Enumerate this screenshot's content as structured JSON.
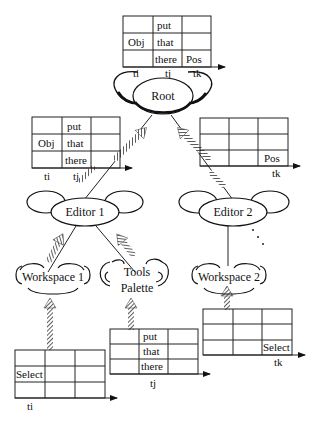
{
  "diagram": {
    "nodes": {
      "root": {
        "label": "Root"
      },
      "editor1": {
        "label": "Editor 1"
      },
      "editor2": {
        "label": "Editor 2"
      },
      "workspace1": {
        "label": "Workspace 1"
      },
      "tools_palette": {
        "label_line1": "Tools",
        "label_line2": "Palette"
      },
      "workspace2": {
        "label": "Workspace 2"
      }
    },
    "tables": {
      "root_table": {
        "cells": [
          [
            "",
            "put",
            ""
          ],
          [
            "Obj",
            "that",
            ""
          ],
          [
            "",
            "there",
            "Pos"
          ]
        ],
        "axis_labels": [
          "ti",
          "tj",
          "tk"
        ]
      },
      "editor1_table": {
        "cells": [
          [
            "",
            "put",
            ""
          ],
          [
            "Obj",
            "that",
            ""
          ],
          [
            "",
            "there",
            ""
          ]
        ],
        "axis_labels": [
          "ti",
          "tj"
        ]
      },
      "editor2_table": {
        "cells": [
          [
            "",
            "",
            ""
          ],
          [
            "",
            "",
            ""
          ],
          [
            "",
            "",
            "Pos"
          ]
        ],
        "axis_labels": [
          "tk"
        ]
      },
      "workspace1_table": {
        "cells": [
          [
            "",
            "",
            ""
          ],
          [
            "Select",
            "",
            ""
          ],
          [
            "",
            "",
            ""
          ]
        ],
        "axis_labels": [
          "ti"
        ]
      },
      "tools_table": {
        "cells": [
          [
            "",
            "put",
            ""
          ],
          [
            "",
            "that",
            ""
          ],
          [
            "",
            "there",
            ""
          ]
        ],
        "axis_labels": [
          "tj"
        ]
      },
      "workspace2_table": {
        "cells": [
          [
            "",
            "",
            ""
          ],
          [
            "",
            "",
            ""
          ],
          [
            "",
            "",
            "Select"
          ]
        ],
        "axis_labels": [
          "tk"
        ]
      }
    },
    "edges": [
      {
        "from": "Root",
        "to": "Editor 1"
      },
      {
        "from": "Root",
        "to": "Editor 2"
      },
      {
        "from": "Editor 1",
        "to": "Workspace 1"
      },
      {
        "from": "Editor 1",
        "to": "Tools Palette"
      },
      {
        "from": "Editor 2",
        "to": "Workspace 2"
      },
      {
        "from": "Editor 2",
        "to": "…",
        "style": "dotted"
      }
    ]
  }
}
